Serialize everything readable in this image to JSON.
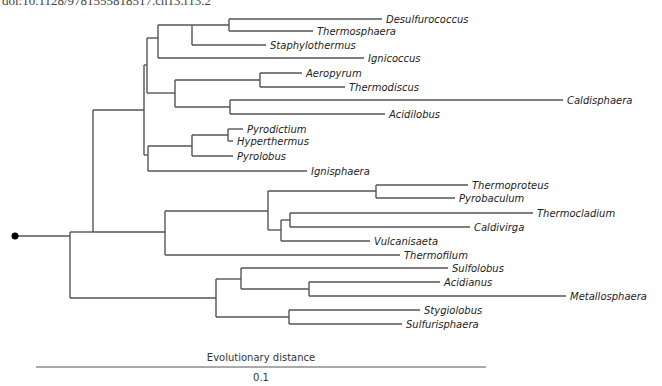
{
  "header": {
    "doi": "doi:10.1128/9781555818517.ch13.f13.2"
  },
  "colors": {
    "branch": "#555555",
    "label": "#222222",
    "root_dot": "#000000"
  },
  "tree": {
    "root": {
      "x": 15,
      "y": 236
    },
    "nodes": [
      {
        "id": "root",
        "x": 70,
        "y1": 232,
        "y2": 298
      },
      {
        "id": "L",
        "x": 93,
        "y1": 110,
        "y2": 232
      },
      {
        "id": "K",
        "x": 144,
        "y1": 65,
        "y2": 155
      },
      {
        "id": "G",
        "x": 147,
        "y1": 38,
        "y2": 93
      },
      {
        "id": "C",
        "x": 158,
        "y1": 25,
        "y2": 58
      },
      {
        "id": "B",
        "x": 192,
        "y1": 25,
        "y2": 45
      },
      {
        "id": "A",
        "x": 229,
        "y1": 19,
        "y2": 31
      },
      {
        "id": "F",
        "x": 175,
        "y1": 80,
        "y2": 107
      },
      {
        "id": "D",
        "x": 260,
        "y1": 73,
        "y2": 87
      },
      {
        "id": "E",
        "x": 230,
        "y1": 100,
        "y2": 114
      },
      {
        "id": "J",
        "x": 148,
        "y1": 146,
        "y2": 171
      },
      {
        "id": "I",
        "x": 192,
        "y1": 135,
        "y2": 156
      },
      {
        "id": "H",
        "x": 228,
        "y1": 129,
        "y2": 141
      },
      {
        "id": "M",
        "x": 165,
        "y1": 211,
        "y2": 255
      },
      {
        "id": "N",
        "x": 268,
        "y1": 191,
        "y2": 230
      },
      {
        "id": "TP",
        "x": 376,
        "y1": 185,
        "y2": 198
      },
      {
        "id": "P",
        "x": 281,
        "y1": 220,
        "y2": 241
      },
      {
        "id": "O",
        "x": 290,
        "y1": 213,
        "y2": 227
      },
      {
        "id": "Q",
        "x": 216,
        "y1": 279,
        "y2": 317
      },
      {
        "id": "R",
        "x": 241,
        "y1": 268,
        "y2": 289
      },
      {
        "id": "S",
        "x": 309,
        "y1": 282,
        "y2": 296
      },
      {
        "id": "T",
        "x": 289,
        "y1": 310,
        "y2": 324
      }
    ],
    "internal_branches": [
      {
        "x1": 15,
        "x2": 70,
        "y": 236
      },
      {
        "x1": 70,
        "x2": 93,
        "y": 232
      },
      {
        "x1": 70,
        "x2": 216,
        "y": 298
      },
      {
        "x1": 93,
        "x2": 144,
        "y": 110
      },
      {
        "x1": 93,
        "x2": 165,
        "y": 232
      },
      {
        "x1": 144,
        "x2": 147,
        "y": 65
      },
      {
        "x1": 144,
        "x2": 148,
        "y": 155
      },
      {
        "x1": 147,
        "x2": 158,
        "y": 38
      },
      {
        "x1": 147,
        "x2": 175,
        "y": 93
      },
      {
        "x1": 158,
        "x2": 192,
        "y": 25
      },
      {
        "x1": 192,
        "x2": 229,
        "y": 25
      },
      {
        "x1": 175,
        "x2": 260,
        "y": 80
      },
      {
        "x1": 175,
        "x2": 230,
        "y": 107
      },
      {
        "x1": 148,
        "x2": 192,
        "y": 146
      },
      {
        "x1": 192,
        "x2": 228,
        "y": 135
      },
      {
        "x1": 165,
        "x2": 268,
        "y": 211
      },
      {
        "x1": 268,
        "x2": 376,
        "y": 191
      },
      {
        "x1": 268,
        "x2": 281,
        "y": 230
      },
      {
        "x1": 281,
        "x2": 290,
        "y": 220
      },
      {
        "x1": 216,
        "x2": 241,
        "y": 279
      },
      {
        "x1": 216,
        "x2": 289,
        "y": 317
      },
      {
        "x1": 241,
        "x2": 309,
        "y": 289
      }
    ],
    "leaves": [
      {
        "name": "Desulfurococcus",
        "parent_x": 229,
        "x_end": 382,
        "y": 19
      },
      {
        "name": "Thermosphaera",
        "parent_x": 229,
        "x_end": 313,
        "y": 31
      },
      {
        "name": "Staphylothermus",
        "parent_x": 192,
        "x_end": 266,
        "y": 45
      },
      {
        "name": "Ignicoccus",
        "parent_x": 158,
        "x_end": 364,
        "y": 58
      },
      {
        "name": "Aeropyrum",
        "parent_x": 260,
        "x_end": 302,
        "y": 73
      },
      {
        "name": "Thermodiscus",
        "parent_x": 260,
        "x_end": 345,
        "y": 87
      },
      {
        "name": "Caldisphaera",
        "parent_x": 230,
        "x_end": 563,
        "y": 100
      },
      {
        "name": "Acidilobus",
        "parent_x": 230,
        "x_end": 385,
        "y": 114
      },
      {
        "name": "Pyrodictium",
        "parent_x": 228,
        "x_end": 243,
        "y": 129
      },
      {
        "name": "Hyperthermus",
        "parent_x": 228,
        "x_end": 233,
        "y": 141
      },
      {
        "name": "Pyrolobus",
        "parent_x": 192,
        "x_end": 233,
        "y": 156
      },
      {
        "name": "Ignisphaera",
        "parent_x": 148,
        "x_end": 307,
        "y": 171
      },
      {
        "name": "Thermoproteus",
        "parent_x": 376,
        "x_end": 468,
        "y": 185
      },
      {
        "name": "Pyrobaculum",
        "parent_x": 376,
        "x_end": 455,
        "y": 198
      },
      {
        "name": "Thermocladium",
        "parent_x": 290,
        "x_end": 533,
        "y": 213
      },
      {
        "name": "Caldivirga",
        "parent_x": 290,
        "x_end": 470,
        "y": 227
      },
      {
        "name": "Vulcanisaeta",
        "parent_x": 281,
        "x_end": 370,
        "y": 241
      },
      {
        "name": "Thermofilum",
        "parent_x": 165,
        "x_end": 400,
        "y": 255
      },
      {
        "name": "Sulfolobus",
        "parent_x": 241,
        "x_end": 448,
        "y": 268
      },
      {
        "name": "Acidianus",
        "parent_x": 309,
        "x_end": 440,
        "y": 282
      },
      {
        "name": "Metallosphaera",
        "parent_x": 309,
        "x_end": 566,
        "y": 296
      },
      {
        "name": "Stygiolobus",
        "parent_x": 289,
        "x_end": 420,
        "y": 310
      },
      {
        "name": "Sulfurisphaera",
        "parent_x": 289,
        "x_end": 402,
        "y": 324
      }
    ]
  },
  "scale_bar": {
    "title": "Evolutionary distance",
    "value": "0.1",
    "x1": 36,
    "x2": 486,
    "y": 367
  }
}
